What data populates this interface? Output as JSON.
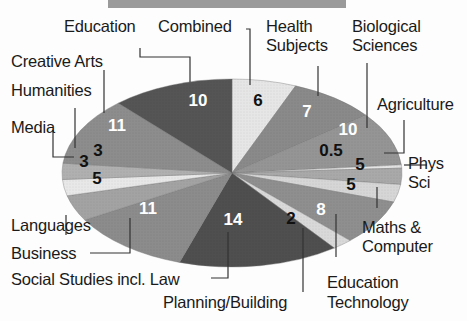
{
  "chart_data": {
    "type": "pie",
    "title": "",
    "slices": [
      {
        "label": "Combined",
        "value": 6,
        "color": "#e6e6e6",
        "value_color": "#111111"
      },
      {
        "label": "Health Subjects",
        "value": 7,
        "color": "#8a8a8a",
        "value_color": "#ffffff"
      },
      {
        "label": "Biological Sciences",
        "value": 10,
        "color": "#959595",
        "value_color": "#ffffff"
      },
      {
        "label": "Agriculture",
        "value": 0.5,
        "color": "#e4e4e4",
        "value_color": "#111111"
      },
      {
        "label": "Phys Sci",
        "value": 5,
        "color": "#a9a9a9",
        "value_color": "#111111"
      },
      {
        "label": "Maths & Computer",
        "value": 5,
        "color": "#d6d6d6",
        "value_color": "#111111"
      },
      {
        "label": "Education Technology",
        "value": 8,
        "color": "#8f8f8f",
        "value_color": "#ffffff"
      },
      {
        "label": "Planning/Building",
        "value": 2,
        "color": "#d9d9d9",
        "value_color": "#111111"
      },
      {
        "label": "Social Studies incl. Law",
        "value": 14,
        "color": "#4f4f4f",
        "value_color": "#ffffff"
      },
      {
        "label": "Business",
        "value": 11,
        "color": "#8c8c8c",
        "value_color": "#ffffff"
      },
      {
        "label": "Languages",
        "value": 5,
        "color": "#a3a3a3",
        "value_color": "#111111"
      },
      {
        "label": "Media",
        "value": 3,
        "color": "#e8e8e8",
        "value_color": "#111111"
      },
      {
        "label": "Humanities",
        "value": 3,
        "color": "#b0b0b0",
        "value_color": "#111111"
      },
      {
        "label": "Creative Arts",
        "value": 11,
        "color": "#8d8d8d",
        "value_color": "#ffffff"
      },
      {
        "label": "Education",
        "value": 10,
        "color": "#555555",
        "value_color": "#ffffff"
      }
    ],
    "legend_position": "callout labels around pie",
    "grid": false
  },
  "labels": {
    "education": "Education",
    "combined": "Combined",
    "health_1": "Health",
    "health_2": "Subjects",
    "bio_1": "Biological",
    "bio_2": "Sciences",
    "agriculture": "Agriculture",
    "phys_1": "Phys",
    "phys_2": "Sci",
    "maths_1": "Maths &",
    "maths_2": "Computer",
    "edtech_1": "Education",
    "edtech_2": "Technology",
    "planning": "Planning/Building",
    "social": "Social Studies incl. Law",
    "business": "Business",
    "languages": "Languages",
    "media": "Media",
    "humanities": "Humanities",
    "creative": "Creative Arts"
  },
  "values": {
    "combined": "6",
    "health": "7",
    "bio": "10",
    "agriculture": "0.5",
    "phys": "5",
    "maths": "5",
    "edtech": "8",
    "planning": "2",
    "social": "14",
    "business": "11",
    "languages": "5",
    "media": "3",
    "humanities": "3",
    "creative": "11",
    "education": "10"
  }
}
